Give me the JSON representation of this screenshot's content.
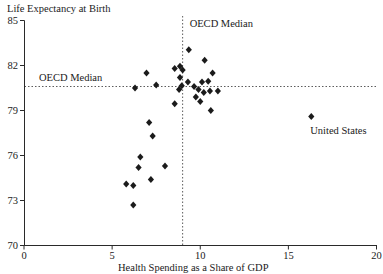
{
  "chart_data": {
    "type": "scatter",
    "title": "Life Expectancy at Birth",
    "xlabel": "Health Spending as a Share of GDP",
    "ylabel": "Life Expectancy at Birth",
    "xlim": [
      0,
      20
    ],
    "ylim": [
      70,
      85
    ],
    "x_ticks": [
      0,
      5,
      10,
      15,
      20
    ],
    "y_ticks": [
      70,
      73,
      76,
      79,
      82,
      85
    ],
    "x_tick_labels": [
      "0",
      "5",
      "10",
      "15",
      "20"
    ],
    "y_tick_labels": [
      "70",
      "73",
      "76",
      "79",
      "82",
      "85"
    ],
    "grid": false,
    "legend": "none",
    "marker": "diamond",
    "marker_color": "#1b1b1b",
    "oecd_median_x": 9.0,
    "oecd_median_y": 80.6,
    "annotations": {
      "vline_label": "OECD Median",
      "hline_label": "OECD Median",
      "us_label": "United States"
    },
    "points": [
      [
        6.2,
        72.7
      ],
      [
        5.8,
        74.1
      ],
      [
        6.2,
        74.0
      ],
      [
        7.2,
        74.4
      ],
      [
        6.5,
        75.2
      ],
      [
        8.0,
        75.3
      ],
      [
        6.6,
        75.9
      ],
      [
        7.3,
        77.3
      ],
      [
        7.1,
        78.2
      ],
      [
        8.55,
        79.45
      ],
      [
        9.75,
        79.9
      ],
      [
        10.0,
        79.6
      ],
      [
        10.6,
        79.0
      ],
      [
        6.3,
        80.5
      ],
      [
        7.5,
        80.7
      ],
      [
        8.8,
        80.4
      ],
      [
        8.95,
        80.65
      ],
      [
        9.3,
        80.9
      ],
      [
        9.65,
        80.6
      ],
      [
        9.9,
        80.4
      ],
      [
        10.1,
        80.9
      ],
      [
        10.45,
        80.95
      ],
      [
        10.2,
        80.2
      ],
      [
        10.55,
        80.3
      ],
      [
        11.0,
        80.3
      ],
      [
        8.85,
        81.2
      ],
      [
        8.55,
        81.8
      ],
      [
        8.85,
        81.95
      ],
      [
        9.0,
        81.7
      ],
      [
        6.95,
        81.5
      ],
      [
        10.7,
        81.5
      ],
      [
        10.25,
        82.35
      ],
      [
        9.35,
        83.05
      ]
    ],
    "us_point": [
      16.3,
      78.6
    ]
  }
}
